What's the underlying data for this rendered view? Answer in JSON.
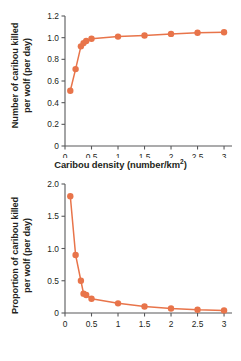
{
  "figure": {
    "background": "#ffffff",
    "accent_color": "#e8744a",
    "text_color": "#231f20",
    "axis_color": "#58595b"
  },
  "chart_data": [
    {
      "type": "line",
      "panel": "top",
      "title": "",
      "xlabel_text": "Caribou density (number/km",
      "xlabel_sup": "2",
      "xlabel_tail": ")",
      "ylabel_line1": "Number of caribou killed",
      "ylabel_line2": "per wolf (per day)",
      "xlim": [
        0,
        3.15
      ],
      "ylim": [
        0,
        1.2
      ],
      "xticks": [
        0,
        0.5,
        1,
        1.5,
        2,
        2.5,
        3
      ],
      "xticklabels": [
        "0",
        "0.5",
        "1",
        "1.5",
        "2",
        "2.5",
        "3"
      ],
      "yticks": [
        0,
        0.2,
        0.4,
        0.6,
        0.8,
        1.0,
        1.2
      ],
      "yticklabels": [
        "0",
        "0.2",
        "0.4",
        "0.6",
        "0.8",
        "1.0",
        "1.2"
      ],
      "grid": false,
      "legend": "none",
      "marker": "circle",
      "x": [
        0.1,
        0.2,
        0.3,
        0.35,
        0.4,
        0.5,
        1.0,
        1.5,
        2.0,
        2.5,
        3.0
      ],
      "y": [
        0.51,
        0.71,
        0.92,
        0.95,
        0.97,
        0.99,
        1.01,
        1.02,
        1.035,
        1.045,
        1.05
      ]
    },
    {
      "type": "line",
      "panel": "bottom",
      "title": "",
      "xlabel_text": "Caribou density (number/km",
      "xlabel_sup": "2",
      "xlabel_tail": ")",
      "ylabel_line1": "Proportion of caribou killed",
      "ylabel_line2": "per wolf (per day)",
      "xlim": [
        0,
        3.15
      ],
      "ylim": [
        0,
        2.0
      ],
      "xticks": [
        0,
        0.5,
        1,
        1.5,
        2,
        2.5,
        3
      ],
      "xticklabels": [
        "0",
        "0.5",
        "1",
        "1.5",
        "2",
        "2.5",
        "3"
      ],
      "yticks": [
        0,
        0.5,
        1.0,
        1.5,
        2.0
      ],
      "yticklabels": [
        "0",
        "0.5",
        "1.0",
        "1.5",
        "2.0"
      ],
      "grid": false,
      "legend": "none",
      "marker": "circle",
      "x": [
        0.1,
        0.2,
        0.3,
        0.35,
        0.4,
        0.5,
        1.0,
        1.5,
        2.0,
        2.5,
        3.0
      ],
      "y": [
        1.81,
        0.9,
        0.5,
        0.3,
        0.28,
        0.22,
        0.15,
        0.1,
        0.07,
        0.05,
        0.04
      ]
    }
  ]
}
